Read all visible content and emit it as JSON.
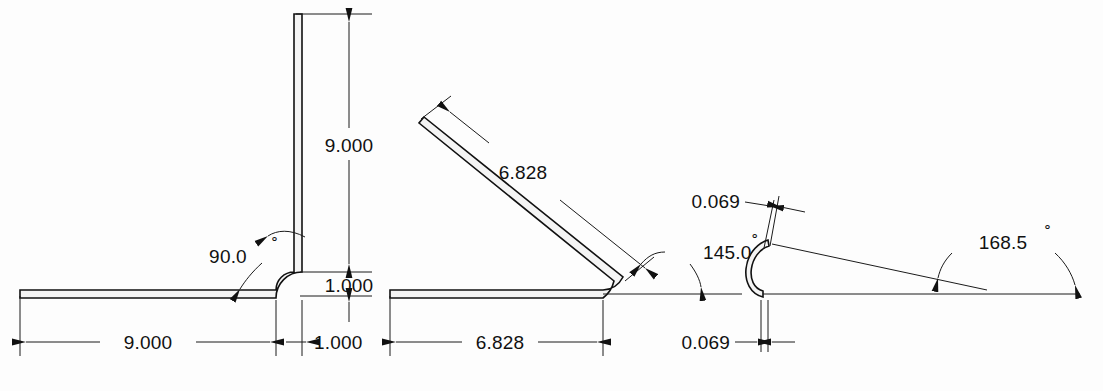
{
  "drawing": {
    "title": "Sheet Metal Bend Profiles",
    "background_color": "#fdfdfd",
    "line_color": "#111111",
    "part_fill_color": "#f4f4f4",
    "degree_symbol": "˚"
  },
  "views": [
    {
      "id": "view-90",
      "name": "ninety-degree-bend",
      "bend_angle_label": "90.0",
      "dimensions": {
        "horizontal_leg": "9.000",
        "vertical_leg": "9.000",
        "vertical_offset": "1.000",
        "horizontal_offset": "1.000"
      }
    },
    {
      "id": "view-145",
      "name": "one-forty-five-degree-bend",
      "bend_angle_label": "145.0",
      "dimensions": {
        "angled_leg": "6.828",
        "horizontal_leg": "6.828"
      }
    },
    {
      "id": "view-168",
      "name": "one-sixty-eight-point-five-degree-bend",
      "bend_angle_label": "168.5",
      "dimensions": {
        "thickness_upper": "0.069",
        "thickness_lower": "0.069"
      }
    }
  ],
  "labels": {
    "v1_vertical_9000": "9.000",
    "v1_vertical_1000": "1.000",
    "v1_horizontal_9000": "9.000",
    "v1_horizontal_1000": "1.000",
    "v1_angle": "90.0",
    "v2_angled_6828": "6.828",
    "v2_horizontal_6828": "6.828",
    "v2_angle": "145.0",
    "v3_upper_0069": "0.069",
    "v3_lower_0069": "0.069",
    "v3_angle": "168.5"
  }
}
